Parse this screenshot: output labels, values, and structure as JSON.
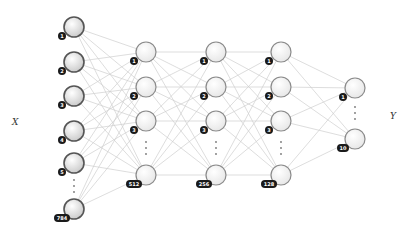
{
  "diagram": {
    "type": "neural-network",
    "input_label": "X",
    "output_label": "Y",
    "colors": {
      "edge": "#cfcfcf",
      "node_stroke": "#8a8a8a",
      "input_node_stroke": "#555555",
      "badge_bg": "#1a1a1a",
      "badge_text": "#ffffff"
    },
    "layers": [
      {
        "name": "input",
        "x": 74,
        "size": 784,
        "nodes": [
          {
            "label": "1",
            "y": 27
          },
          {
            "label": "2",
            "y": 62
          },
          {
            "label": "3",
            "y": 96
          },
          {
            "label": "4",
            "y": 131
          },
          {
            "label": "5",
            "y": 163
          },
          {
            "label": "784",
            "y": 209
          }
        ],
        "ellipsis_y": 186
      },
      {
        "name": "hidden-1",
        "x": 146,
        "size": 512,
        "nodes": [
          {
            "label": "1",
            "y": 52
          },
          {
            "label": "2",
            "y": 87
          },
          {
            "label": "3",
            "y": 121
          },
          {
            "label": "512",
            "y": 175
          }
        ],
        "ellipsis_y": 148
      },
      {
        "name": "hidden-2",
        "x": 216,
        "size": 256,
        "nodes": [
          {
            "label": "1",
            "y": 52
          },
          {
            "label": "2",
            "y": 87
          },
          {
            "label": "3",
            "y": 121
          },
          {
            "label": "256",
            "y": 175
          }
        ],
        "ellipsis_y": 148
      },
      {
        "name": "hidden-3",
        "x": 281,
        "size": 128,
        "nodes": [
          {
            "label": "1",
            "y": 52
          },
          {
            "label": "2",
            "y": 87
          },
          {
            "label": "3",
            "y": 121
          },
          {
            "label": "128",
            "y": 175
          }
        ],
        "ellipsis_y": 148
      },
      {
        "name": "output",
        "x": 355,
        "size": 10,
        "nodes": [
          {
            "label": "1",
            "y": 88
          },
          {
            "label": "10",
            "y": 139
          }
        ],
        "ellipsis_y": 113
      }
    ]
  }
}
